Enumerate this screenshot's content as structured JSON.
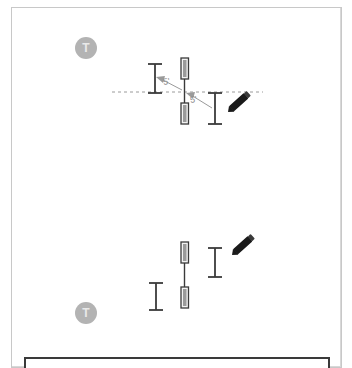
{
  "app": {
    "canvas_background": "#ffffff",
    "sheet_border_color": "#c8c8c8"
  },
  "badges": [
    {
      "name": "text-tool-badge-top",
      "label": "T",
      "x": 75,
      "y": 37,
      "color": "#b3b3b3"
    },
    {
      "name": "text-tool-badge-bottom",
      "label": "T",
      "x": 75,
      "y": 302,
      "color": "#b3b3b3"
    }
  ],
  "dimensions": [
    {
      "name": "dimension-left",
      "value": "5'",
      "x": 163,
      "y": 77,
      "color": "#8e8e8e"
    },
    {
      "name": "dimension-right",
      "value": "5'",
      "x": 190,
      "y": 95,
      "color": "#8e8e8e"
    }
  ],
  "guideline": {
    "name": "alignment-guide",
    "style": "dashed",
    "color": "#9a9a9a",
    "x1": 112,
    "y1": 92,
    "x2": 263,
    "y2": 92
  },
  "walls": {
    "color": "#3a3a3a",
    "fill": "#8a8a8a",
    "upper_group": [
      {
        "name": "wall-segment-upper-top",
        "x": 181,
        "y": 58,
        "w": 7,
        "h": 21
      },
      {
        "name": "wall-segment-upper-bottom",
        "x": 181,
        "y": 103,
        "w": 7,
        "h": 21
      }
    ],
    "lower_group": [
      {
        "name": "wall-segment-lower-top",
        "x": 181,
        "y": 242,
        "w": 7,
        "h": 21
      },
      {
        "name": "wall-segment-lower-bottom",
        "x": 181,
        "y": 287,
        "w": 7,
        "h": 21
      }
    ]
  },
  "extension_markers": [
    {
      "name": "extension-marker-upper-left",
      "x": 155,
      "y1": 64,
      "y2": 93
    },
    {
      "name": "extension-marker-upper-right",
      "x": 215,
      "y1": 93,
      "y2": 124
    },
    {
      "name": "extension-marker-lower-left",
      "x": 156,
      "y1": 283,
      "y2": 310
    },
    {
      "name": "extension-marker-lower-right",
      "x": 215,
      "y1": 248,
      "y2": 277
    }
  ],
  "cursors": [
    {
      "name": "pencil-cursor-upper",
      "x": 228,
      "y": 112,
      "rotation": -42
    },
    {
      "name": "pencil-cursor-lower",
      "x": 232,
      "y": 240,
      "rotation": -42
    }
  ],
  "bottom_panel": {
    "name": "bottom-toolbar-panel",
    "border_color": "#3a3a3a"
  }
}
